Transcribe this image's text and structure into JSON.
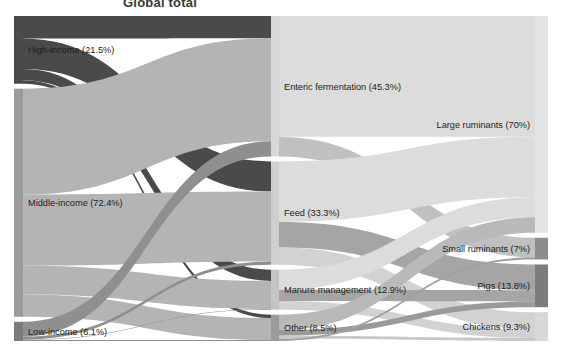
{
  "title": "Global total",
  "colors": {
    "dark": "#4a4a4a",
    "mid": "#9b9b9b",
    "light": "#d8d8d8",
    "lighter": "#e3e3e3",
    "pale": "#ececec",
    "background": "#ffffff",
    "text": "#1d1d1d"
  },
  "chart_data": {
    "type": "sankey",
    "title": "Global total",
    "xlabel": "",
    "ylabel": "",
    "grid": false,
    "legend": "none",
    "units": "percent of global total livestock emissions",
    "columns": [
      {
        "id": "income",
        "name": "Income group",
        "nodes": [
          {
            "id": "high",
            "label": "High-income (21.5%)",
            "value": 21.5,
            "color": "#4a4a4a"
          },
          {
            "id": "middle",
            "label": "Middle-income (72.4%)",
            "value": 72.4,
            "color": "#9b9b9b"
          },
          {
            "id": "low",
            "label": "Low-income (6.1%)",
            "value": 6.1,
            "color": "#7b7b7b"
          }
        ]
      },
      {
        "id": "source",
        "name": "Emission source",
        "nodes": [
          {
            "id": "enteric",
            "label": "Enteric fermentation (45.3%)",
            "value": 45.3,
            "color": "#d8d8d8"
          },
          {
            "id": "feed",
            "label": "Feed (33.3%)",
            "value": 33.3,
            "color": "#cfcfcf"
          },
          {
            "id": "manure",
            "label": "Manure management (12.9%)",
            "value": 12.9,
            "color": "#c4c4c4"
          },
          {
            "id": "other",
            "label": "Other (8.5%)",
            "value": 8.5,
            "color": "#9b9b9b"
          }
        ]
      },
      {
        "id": "animal",
        "name": "Animal type",
        "nodes": [
          {
            "id": "large",
            "label": "Large ruminants (70%)",
            "value": 70.0,
            "color": "#e3e3e3"
          },
          {
            "id": "small",
            "label": "Small ruminants (7%)",
            "value": 7.0,
            "color": "#8d8d8d"
          },
          {
            "id": "pigs",
            "label": "Pigs (13.8%)",
            "value": 13.8,
            "color": "#7c7c7c"
          },
          {
            "id": "chick",
            "label": "Chickens (9.3%)",
            "value": 9.3,
            "color": "#d8d8d8"
          }
        ]
      }
    ],
    "links": [
      {
        "source": "high",
        "target": "enteric",
        "value": 7.2,
        "color": "#4a4a4a"
      },
      {
        "source": "high",
        "target": "feed",
        "value": 9.6,
        "color": "#4a4a4a"
      },
      {
        "source": "high",
        "target": "manure",
        "value": 3.6,
        "color": "#4a4a4a"
      },
      {
        "source": "high",
        "target": "other",
        "value": 1.1,
        "color": "#4a4a4a"
      },
      {
        "source": "middle",
        "target": "enteric",
        "value": 33.2,
        "color": "#b4b4b4"
      },
      {
        "source": "middle",
        "target": "feed",
        "value": 22.3,
        "color": "#b4b4b4"
      },
      {
        "source": "middle",
        "target": "manure",
        "value": 9.0,
        "color": "#b4b4b4"
      },
      {
        "source": "middle",
        "target": "other",
        "value": 7.0,
        "color": "#b4b4b4"
      },
      {
        "source": "low",
        "target": "enteric",
        "value": 4.9,
        "color": "#8f8f8f"
      },
      {
        "source": "low",
        "target": "feed",
        "value": 1.0,
        "color": "#8f8f8f"
      },
      {
        "source": "low",
        "target": "manure",
        "value": 0.2,
        "color": "#8f8f8f"
      },
      {
        "source": "low",
        "target": "other",
        "value": 0.3,
        "color": "#8f8f8f"
      },
      {
        "source": "enteric",
        "target": "large",
        "value": 39.0,
        "color": "#dcdcdc"
      },
      {
        "source": "enteric",
        "target": "small",
        "value": 6.3,
        "color": "#c0c0c0"
      },
      {
        "source": "feed",
        "target": "large",
        "value": 19.5,
        "color": "#dcdcdc"
      },
      {
        "source": "feed",
        "target": "pigs",
        "value": 8.3,
        "color": "#a5a5a5"
      },
      {
        "source": "feed",
        "target": "chick",
        "value": 5.5,
        "color": "#d2d2d2"
      },
      {
        "source": "manure",
        "target": "large",
        "value": 6.5,
        "color": "#dcdcdc"
      },
      {
        "source": "manure",
        "target": "pigs",
        "value": 3.6,
        "color": "#a5a5a5"
      },
      {
        "source": "manure",
        "target": "chick",
        "value": 2.8,
        "color": "#d2d2d2"
      },
      {
        "source": "other",
        "target": "large",
        "value": 5.0,
        "color": "#b9b9b9"
      },
      {
        "source": "other",
        "target": "pigs",
        "value": 1.9,
        "color": "#9a9a9a"
      },
      {
        "source": "other",
        "target": "chick",
        "value": 1.0,
        "color": "#c8c8c8"
      },
      {
        "source": "other",
        "target": "small",
        "value": 0.7,
        "color": "#a0a0a0"
      }
    ]
  },
  "geometry": {
    "node_x": {
      "income": 14,
      "source": 271,
      "animal": 535
    },
    "node_w": {
      "income": 9,
      "source": 8,
      "animal": 13
    },
    "top": 16,
    "bottom": 341,
    "gap": 5
  }
}
